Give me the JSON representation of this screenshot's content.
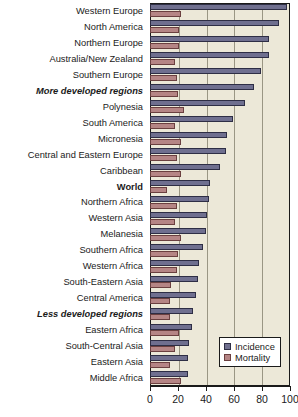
{
  "chart_data": {
    "type": "bar",
    "orientation": "horizontal",
    "title": "",
    "subtitle": "",
    "xlabel": "",
    "ylabel": "",
    "xlim": [
      0,
      100
    ],
    "xticks": [
      0,
      20,
      40,
      60,
      80,
      100
    ],
    "xticklabels": [
      "0",
      "20",
      "40",
      "60",
      "80",
      "100"
    ],
    "grid": true,
    "grid_axis": "x",
    "legend_position": "bottom-right",
    "legend": [
      "Incidence",
      "Mortality"
    ],
    "categories": [
      "Western Europe",
      "North America",
      "Northern Europe",
      "Australia/New Zealand",
      "Southern Europe",
      "More developed regions",
      "Polynesia",
      "South America",
      "Micronesia",
      "Central and Eastern Europe",
      "Caribbean",
      "World",
      "Northern Africa",
      "Western Asia",
      "Melanesia",
      "Southern Africa",
      "Western Africa",
      "South-Eastern Asia",
      "Central America",
      "Less developed regions",
      "Eastern Africa",
      "South-Central Asia",
      "Eastern Asia",
      "Middle Africa"
    ],
    "category_styles": [
      "normal",
      "normal",
      "normal",
      "normal",
      "normal",
      "bolditalic",
      "normal",
      "normal",
      "normal",
      "normal",
      "normal",
      "bold",
      "normal",
      "normal",
      "normal",
      "normal",
      "normal",
      "normal",
      "normal",
      "bolditalic",
      "normal",
      "normal",
      "normal",
      "normal"
    ],
    "series": [
      {
        "name": "Incidence",
        "color": "#6f6f8f",
        "values": [
          98,
          92,
          85,
          85,
          79,
          74,
          68,
          59,
          55,
          54,
          50,
          43,
          42,
          41,
          40,
          38,
          35,
          34,
          33,
          31,
          30,
          28,
          27,
          27
        ]
      },
      {
        "name": "Mortality",
        "color": "#b58585",
        "values": [
          22,
          21,
          21,
          18,
          19,
          20,
          24,
          18,
          22,
          19,
          22,
          12,
          19,
          18,
          22,
          20,
          19,
          15,
          14,
          14,
          21,
          18,
          14,
          22
        ]
      }
    ],
    "colors": {
      "incidence": "#6f6f8f",
      "mortality": "#b58585",
      "plot_background": "#ece8d8",
      "gridline": "#9a9684",
      "axis": "#1a1a1a",
      "legend_background": "#ffffff"
    }
  }
}
